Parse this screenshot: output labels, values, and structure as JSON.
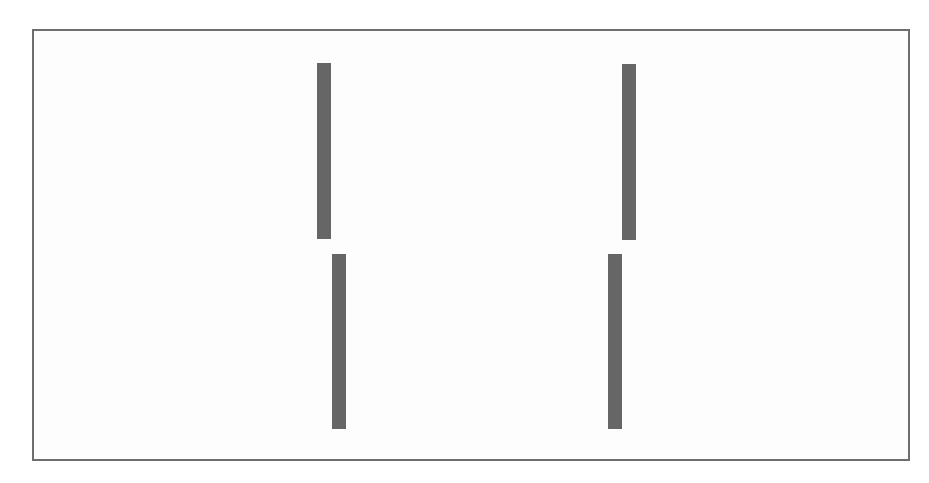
{
  "figure": {
    "colors": {
      "frame_border": "#6e6e6e",
      "background": "#fdfdfd",
      "bar": "#666666"
    },
    "bars": [
      {
        "id": "top-left"
      },
      {
        "id": "bottom-left"
      },
      {
        "id": "top-right"
      },
      {
        "id": "bottom-right"
      }
    ]
  }
}
